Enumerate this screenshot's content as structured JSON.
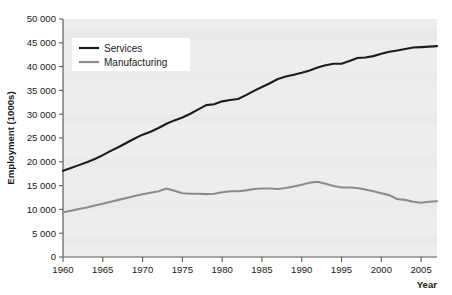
{
  "chart_data": {
    "type": "line",
    "title": "",
    "xlabel": "Year",
    "ylabel": "Employment (1000s)",
    "xlim": [
      1960,
      2007
    ],
    "ylim": [
      0,
      50000
    ],
    "xticks": [
      1960,
      1965,
      1970,
      1975,
      1980,
      1985,
      1990,
      1995,
      2000,
      2005
    ],
    "xticklabels": [
      "1960",
      "1965",
      "1970",
      "1975",
      "1980",
      "1985",
      "1990",
      "1995",
      "2000",
      "2005"
    ],
    "yticks": [
      0,
      5000,
      10000,
      15000,
      20000,
      25000,
      30000,
      35000,
      40000,
      45000,
      50000
    ],
    "yticklabels": [
      "0",
      "5 000",
      "10 000",
      "15 000",
      "20 000",
      "25 000",
      "30 000",
      "35 000",
      "40 000",
      "45 000",
      "50 000"
    ],
    "grid": false,
    "legend_position": "upper-left",
    "plot_background": "#ededed",
    "x": [
      1960,
      1961,
      1962,
      1963,
      1964,
      1965,
      1966,
      1967,
      1968,
      1969,
      1970,
      1971,
      1972,
      1973,
      1974,
      1975,
      1976,
      1977,
      1978,
      1979,
      1980,
      1981,
      1982,
      1983,
      1984,
      1985,
      1986,
      1987,
      1988,
      1989,
      1990,
      1991,
      1992,
      1993,
      1994,
      1995,
      1996,
      1997,
      1998,
      1999,
      2000,
      2001,
      2002,
      2003,
      2004,
      2005,
      2006,
      2007
    ],
    "series": [
      {
        "name": "Services",
        "color": "#1c1c1c",
        "values": [
          18100,
          18700,
          19300,
          19900,
          20600,
          21400,
          22300,
          23100,
          24000,
          24900,
          25700,
          26300,
          27100,
          28000,
          28700,
          29300,
          30100,
          31000,
          31900,
          32100,
          32700,
          33000,
          33200,
          34000,
          34900,
          35700,
          36500,
          37400,
          37900,
          38300,
          38700,
          39200,
          39800,
          40300,
          40600,
          40600,
          41200,
          41800,
          41900,
          42200,
          42700,
          43100,
          43400,
          43700,
          44000,
          44100,
          44200,
          44300
        ]
      },
      {
        "name": "Manufacturing",
        "color": "#8c8c8c",
        "values": [
          9400,
          9700,
          10100,
          10400,
          10800,
          11200,
          11600,
          12000,
          12400,
          12800,
          13200,
          13500,
          13800,
          14400,
          13900,
          13400,
          13300,
          13300,
          13200,
          13300,
          13600,
          13800,
          13800,
          14000,
          14300,
          14400,
          14400,
          14300,
          14500,
          14800,
          15200,
          15600,
          15800,
          15400,
          14900,
          14600,
          14600,
          14500,
          14200,
          13800,
          13400,
          13000,
          12200,
          12000,
          11600,
          11400,
          11600,
          11700
        ]
      }
    ]
  },
  "axes": {
    "ylabel": "Employment (1000s)",
    "xlabel": "Year"
  },
  "legend": {
    "items": [
      {
        "label": "Services",
        "color": "#1c1c1c"
      },
      {
        "label": "Manufacturing",
        "color": "#8c8c8c"
      }
    ]
  }
}
